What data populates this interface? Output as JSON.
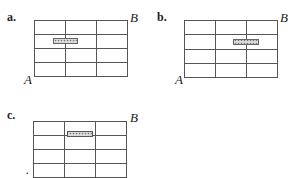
{
  "diagrams": [
    {
      "label": "a.",
      "corner_top_right": "B",
      "corner_bottom_left": "A",
      "rows": 4,
      "cols": 3,
      "shaded_block": {
        "row": 2,
        "position": "spanning columns 1-2"
      }
    },
    {
      "label": "b.",
      "corner_top_right": "B",
      "corner_bottom_left": "A",
      "rows": 4,
      "cols": 3,
      "shaded_block": {
        "row": 2,
        "position": "spanning columns 2-3"
      }
    },
    {
      "label": "c.",
      "corner_top_right": "B",
      "corner_bottom_left": ".",
      "rows": 4,
      "cols": 3,
      "shaded_block": {
        "row": 1,
        "position": "column 2, on bottom edge"
      }
    }
  ],
  "colors": {
    "grid": "#555555",
    "shade": "#888888"
  }
}
